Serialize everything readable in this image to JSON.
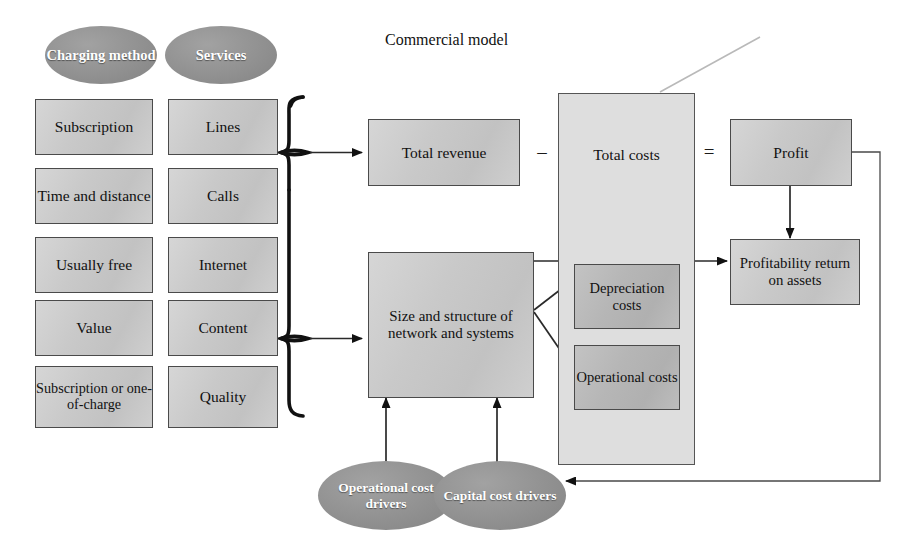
{
  "diagram": {
    "title": "Commercial model",
    "operators": {
      "minus": "–",
      "equals": "="
    },
    "colors": {
      "box_fill": "#c9c9c9",
      "box_fill_dark": "#b6b6b6",
      "container_fill": "#dedede",
      "ellipse_fill": "#909090",
      "border": "#4a4a4a",
      "line": "#2a2a2a",
      "text": "#111111",
      "ellipse_text": "#ffffff",
      "background": "#ffffff"
    },
    "columns": [
      {
        "header": "Charging method",
        "items": [
          "Subscription",
          "Time and distance",
          "Usually free",
          "Value",
          "Subscription or one-of-charge"
        ]
      },
      {
        "header": "Services",
        "items": [
          "Lines",
          "Calls",
          "Internet",
          "Content",
          "Quality"
        ]
      }
    ],
    "model": {
      "total_revenue": "Total revenue",
      "total_costs": "Total costs",
      "profit": "Profit",
      "profitability": "Profitability return on assets",
      "size_structure": "Size and structure of network and systems",
      "depreciation_costs": "Depreciation costs",
      "operational_costs": "Operational costs"
    },
    "drivers": [
      "Operational cost drivers",
      "Capital cost drivers"
    ]
  }
}
